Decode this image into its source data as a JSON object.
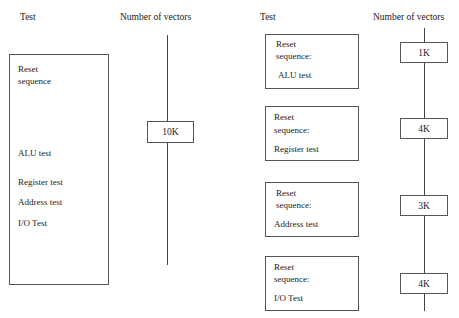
{
  "left": {
    "header_test": "Test",
    "header_vectors": "Number of vectors",
    "box_lines": [
      "Reset",
      "sequence",
      "ALU test",
      "Register test",
      "Address test",
      "I/O Test"
    ],
    "vectors": "10K"
  },
  "right": {
    "header_test": "Test",
    "header_vectors": "Number of vectors",
    "tests": [
      {
        "line1": "Reset",
        "line2": "sequence:",
        "line3": "ALU test",
        "vectors": "1K"
      },
      {
        "line1": "Reset",
        "line2": "sequence:",
        "line3": "Register test",
        "vectors": "4K"
      },
      {
        "line1": "Reset",
        "line2": "sequence:",
        "line3": "Address test",
        "vectors": "3K"
      },
      {
        "line1": "Reset",
        "line2": "sequence:",
        "line3": "I/O Test",
        "vectors": "4K"
      }
    ]
  }
}
